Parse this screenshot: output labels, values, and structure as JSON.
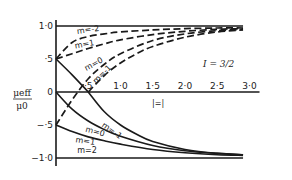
{
  "chart_data": {
    "type": "line",
    "title": "",
    "annotation": "I = 3/2",
    "xlabel": "",
    "x_marker_label": "|=|",
    "ylabel_numerator": "μeff",
    "ylabel_denominator": "μ0",
    "xlim": [
      0,
      3.0
    ],
    "ylim": [
      -1.0,
      1.0
    ],
    "x_ticks": [
      {
        "value": 0.5,
        "label": "·5"
      },
      {
        "value": 1.0,
        "label": "1·0"
      },
      {
        "value": 1.5,
        "label": "1·5"
      },
      {
        "value": 2.0,
        "label": "2·0"
      },
      {
        "value": 2.5,
        "label": "2·5"
      },
      {
        "value": 3.0,
        "label": "3·0"
      }
    ],
    "y_ticks": [
      {
        "value": 1.0,
        "label": "1·0"
      },
      {
        "value": 0.5,
        "label": "·5"
      },
      {
        "value": 0,
        "label": "0"
      },
      {
        "value": -0.5,
        "label": "−·5"
      },
      {
        "value": -1.0,
        "label": "−1·0"
      }
    ],
    "grid": false,
    "series": [
      {
        "name": "m=-2",
        "style": "dashed",
        "group": "upper",
        "x": [
          0,
          0.25,
          0.5,
          0.75,
          1.0,
          1.5,
          2.0,
          2.5,
          2.9
        ],
        "y": [
          0.5,
          0.75,
          0.84,
          0.88,
          0.91,
          0.94,
          0.96,
          0.97,
          0.97
        ]
      },
      {
        "name": "m=1",
        "style": "dashed",
        "group": "upper",
        "x": [
          0,
          0.25,
          0.5,
          0.75,
          1.0,
          1.5,
          2.0,
          2.5,
          2.9
        ],
        "y": [
          0.5,
          0.58,
          0.66,
          0.73,
          0.79,
          0.87,
          0.92,
          0.95,
          0.96
        ]
      },
      {
        "name": "m=0",
        "style": "dashed",
        "group": "upper",
        "x": [
          0,
          0.25,
          0.5,
          0.75,
          1.0,
          1.5,
          2.0,
          2.5,
          2.9
        ],
        "y": [
          -0.5,
          -0.12,
          0.2,
          0.42,
          0.58,
          0.78,
          0.88,
          0.93,
          0.95
        ]
      },
      {
        "name": "m=-1",
        "style": "dashed",
        "group": "upper",
        "x": [
          0.5,
          0.75,
          1.0,
          1.25,
          1.5,
          2.0,
          2.5,
          2.9
        ],
        "y": [
          0,
          0.25,
          0.44,
          0.58,
          0.69,
          0.83,
          0.91,
          0.94
        ]
      },
      {
        "name": "m=-2 (lower)",
        "style": "solid",
        "group": "lower",
        "label": "",
        "x": [
          0,
          0.25,
          0.5
        ],
        "y": [
          0.5,
          0.26,
          0
        ]
      },
      {
        "name": "m=-1",
        "style": "solid",
        "group": "lower",
        "x": [
          0.5,
          0.75,
          1.0,
          1.25,
          1.5,
          2.0,
          2.5,
          2.9
        ],
        "y": [
          0,
          -0.3,
          -0.5,
          -0.64,
          -0.75,
          -0.87,
          -0.93,
          -0.95
        ]
      },
      {
        "name": "m=0",
        "style": "solid",
        "group": "lower",
        "x": [
          0,
          0.25,
          0.5,
          0.75,
          1.0,
          1.5,
          2.0,
          2.5,
          2.9
        ],
        "y": [
          0,
          -0.26,
          -0.44,
          -0.57,
          -0.67,
          -0.81,
          -0.89,
          -0.93,
          -0.95
        ]
      },
      {
        "name": "m=1",
        "style": "solid",
        "group": "lower",
        "x": [
          0,
          0.25,
          0.5,
          0.75,
          1.0,
          1.5,
          2.0,
          2.5,
          2.9
        ],
        "y": [
          -0.5,
          -0.6,
          -0.68,
          -0.74,
          -0.79,
          -0.87,
          -0.92,
          -0.95,
          -0.96
        ]
      },
      {
        "name": "m=2",
        "style": "solid",
        "group": "lower",
        "x": [
          0,
          2.9
        ],
        "y": [
          -1.0,
          -1.0
        ]
      },
      {
        "name": "m=-2 top",
        "style": "solid",
        "group": "upper",
        "x": [
          0,
          2.9
        ],
        "y": [
          1.0,
          1.0
        ]
      }
    ],
    "curve_labels": [
      {
        "text": "m=-2",
        "x": 0.33,
        "y": 0.88,
        "rotate": -8
      },
      {
        "text": "m=1",
        "x": 0.3,
        "y": 0.66,
        "rotate": -10
      },
      {
        "text": "m=0",
        "x": 0.47,
        "y": 0.32,
        "rotate": -28
      },
      {
        "text": "m=-1",
        "x": 0.62,
        "y": 0.12,
        "rotate": -45
      },
      {
        "text": "m=-1",
        "x": 0.7,
        "y": -0.52,
        "rotate": 35
      },
      {
        "text": "m=0",
        "x": 0.45,
        "y": -0.6,
        "rotate": 15
      },
      {
        "text": "m=1",
        "x": 0.3,
        "y": -0.76,
        "rotate": 8
      },
      {
        "text": "m=2",
        "x": 0.33,
        "y": -0.93,
        "rotate": 0
      }
    ]
  }
}
